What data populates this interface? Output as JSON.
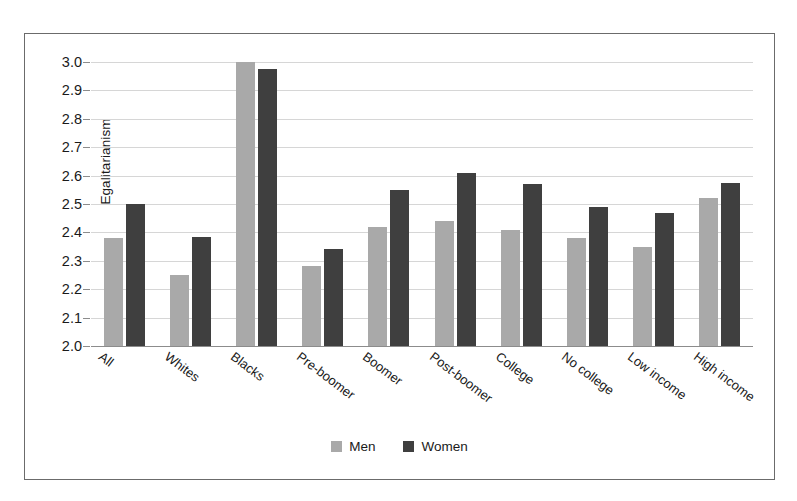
{
  "chart_data": {
    "type": "bar",
    "title": "",
    "xlabel": "",
    "ylabel": "Egalitarianism",
    "ylim": [
      2.0,
      3.0
    ],
    "ytick_step": 0.1,
    "ytick_labels": [
      "3.0",
      "2.9",
      "2.8",
      "2.7",
      "2.6",
      "2.5",
      "2.4",
      "2.3",
      "2.2",
      "2.1",
      "2.0"
    ],
    "grid": true,
    "legend_position": "bottom-center",
    "categories": [
      "All",
      "Whites",
      "Blacks",
      "Pre-boomer",
      "Boomer",
      "Post-boomer",
      "College",
      "No college",
      "Low income",
      "High income"
    ],
    "series": [
      {
        "name": "Men",
        "color": "#a9a9a9",
        "values": [
          2.38,
          2.25,
          3.0,
          2.28,
          2.42,
          2.44,
          2.41,
          2.38,
          2.35,
          2.52
        ]
      },
      {
        "name": "Women",
        "color": "#3f3f3f",
        "values": [
          2.5,
          2.385,
          2.975,
          2.34,
          2.55,
          2.61,
          2.57,
          2.49,
          2.47,
          2.575
        ]
      }
    ]
  }
}
